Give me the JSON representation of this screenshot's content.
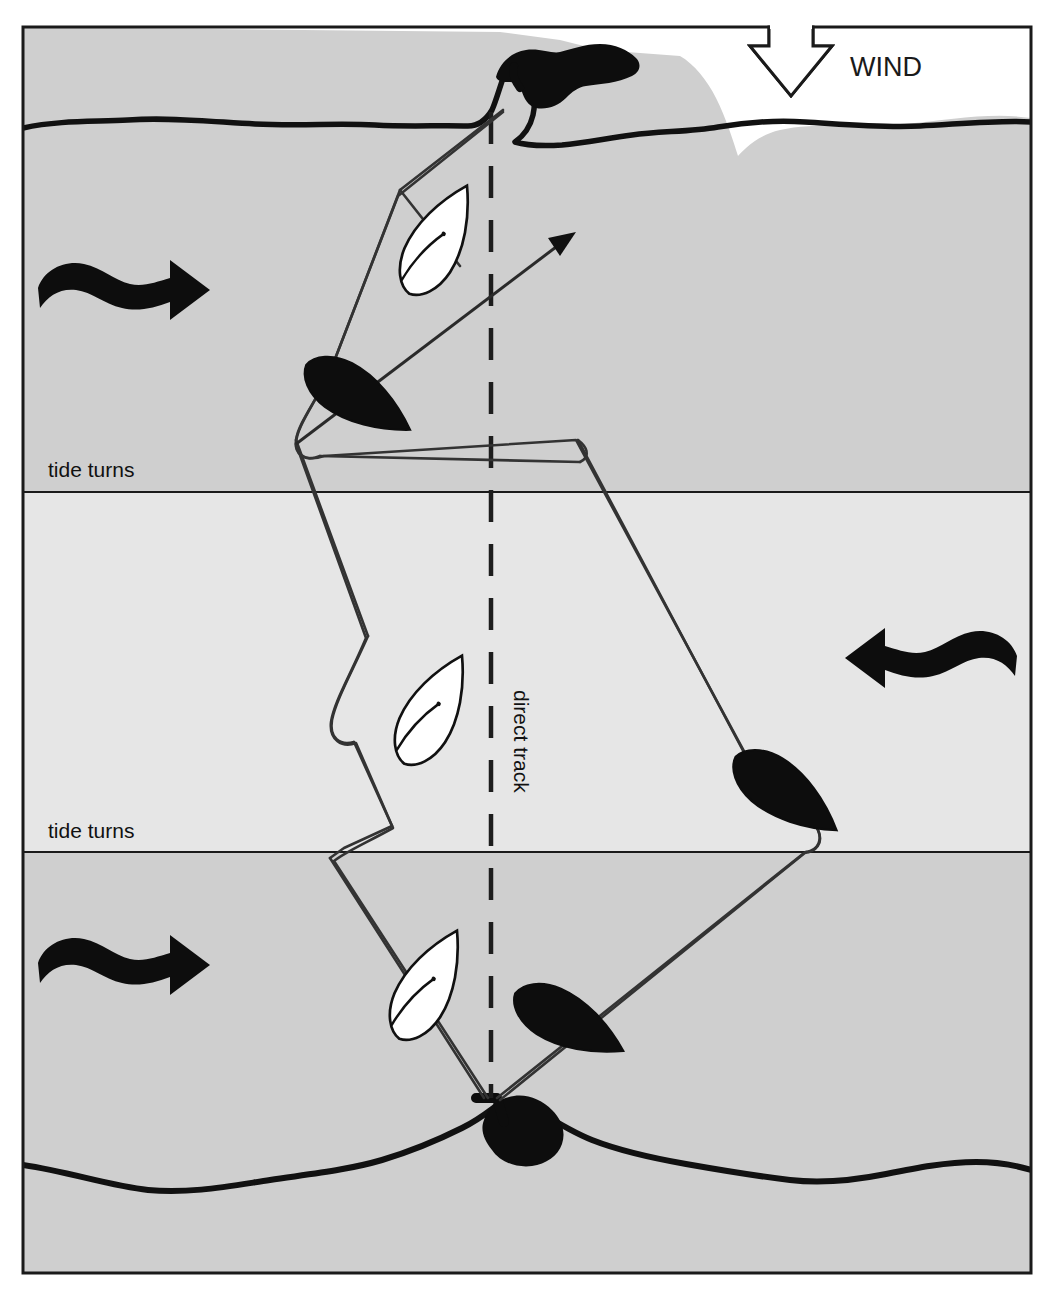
{
  "page": {
    "cut_off_header_text": "",
    "background": "#ffffff"
  },
  "diagram": {
    "type": "nautical-tidal-tacking-diagram",
    "frame": {
      "x": 22,
      "y": 26,
      "width": 1010,
      "height": 1248,
      "stroke": "#1a1a1a"
    },
    "colors": {
      "sea_dark": "#cfcfcf",
      "sea_light": "#e6e6e6",
      "land": "#ffffff",
      "ink": "#111111",
      "boat_black": "#0d0d0d",
      "boat_white": "#ffffff",
      "track": "#333333"
    },
    "bands": [
      {
        "name": "upper-tide-band",
        "y_top": 26,
        "y_bottom": 492,
        "shade": "#cfcfcf",
        "tide_direction": "east"
      },
      {
        "name": "middle-tide-band",
        "y_top": 492,
        "y_bottom": 852,
        "shade": "#e6e6e6",
        "tide_direction": "west"
      },
      {
        "name": "lower-tide-band",
        "y_top": 852,
        "y_bottom": 1274,
        "shade": "#cfcfcf",
        "tide_direction": "east"
      }
    ],
    "labels": {
      "wind": "WIND",
      "tide_turns_upper": "tide turns",
      "tide_turns_lower": "tide turns",
      "direct_track": "direct track"
    },
    "wind_arrow": {
      "name": "wind-arrow",
      "direction": "down",
      "style": "outline",
      "x": 791,
      "y": 26
    },
    "tide_arrows": [
      {
        "name": "tide-arrow-upper-left",
        "direction": "right",
        "x": 40,
        "y": 280
      },
      {
        "name": "tide-arrow-middle-right",
        "direction": "left",
        "x": 845,
        "y": 648
      },
      {
        "name": "tide-arrow-lower-left",
        "direction": "right",
        "x": 40,
        "y": 955
      }
    ],
    "boats": [
      {
        "name": "boat-white-upper",
        "fill": "white",
        "x": 437,
        "y": 242,
        "rotation": 28
      },
      {
        "name": "boat-black-upper",
        "fill": "black",
        "x": 354,
        "y": 395,
        "rotation": 120
      },
      {
        "name": "boat-white-middle",
        "fill": "white",
        "x": 432,
        "y": 712,
        "rotation": 28
      },
      {
        "name": "boat-black-middle",
        "fill": "black",
        "x": 782,
        "y": 790,
        "rotation": 125
      },
      {
        "name": "boat-white-lower",
        "fill": "white",
        "x": 427,
        "y": 985,
        "rotation": 28
      },
      {
        "name": "boat-black-lower",
        "fill": "black",
        "x": 567,
        "y": 1021,
        "rotation": 118
      }
    ],
    "headlands": [
      {
        "name": "headland-top",
        "position": "top",
        "has_harbour_mark": true
      },
      {
        "name": "headland-bottom",
        "position": "bottom",
        "has_harbour_mark": true
      }
    ],
    "direct_track_line": {
      "name": "direct-track-dashed-line",
      "x": 491,
      "y_top": 120,
      "y_bottom": 1100,
      "style": "dashed"
    },
    "course_arrow": {
      "name": "course-arrow",
      "direction": "up-right",
      "from_x": 300,
      "from_y": 430,
      "to_x": 576,
      "to_y": 232
    }
  }
}
